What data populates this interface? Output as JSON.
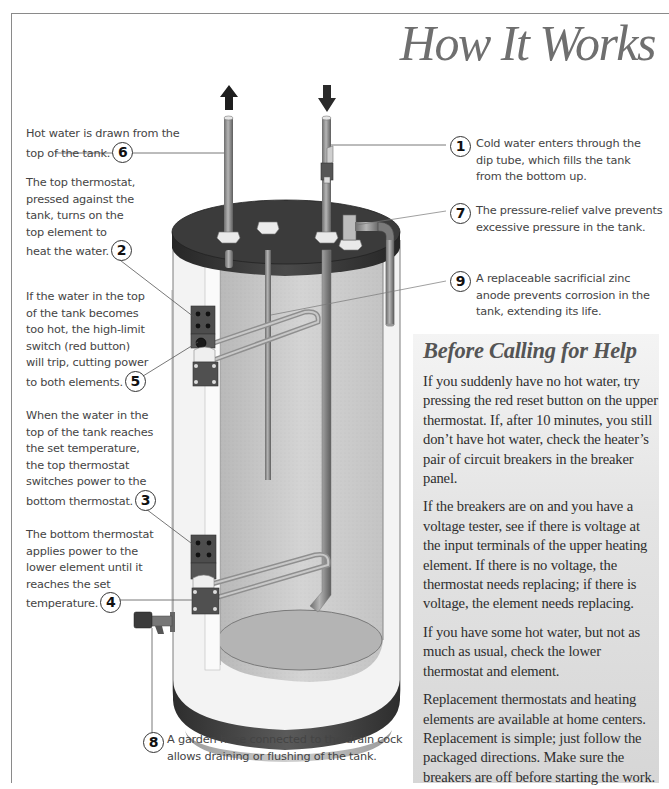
{
  "page": {
    "title": "How It Works"
  },
  "callouts": [
    {
      "number": "1",
      "text": "Cold water enters through the dip tube, which fills the tank from the bottom up."
    },
    {
      "number": "2",
      "text": "The top thermostat, pressed against the tank, turns on the top element to heat the water."
    },
    {
      "number": "3",
      "text": "When the water in the top of the tank reaches the set temperature, the top thermostat switches power to the bottom thermostat."
    },
    {
      "number": "4",
      "text": "The bottom thermostat applies power to the lower element until it reaches the set temperature."
    },
    {
      "number": "5",
      "text": "If the water in the top of the tank becomes too hot, the high-limit switch (red button) will trip, cutting power to both elements."
    },
    {
      "number": "6",
      "text": "Hot water is drawn from the top of the tank."
    },
    {
      "number": "7",
      "text": "The pressure-relief valve prevents excessive pressure in the tank."
    },
    {
      "number": "8",
      "text": "A garden hose connected to the drain cock allows draining or flushing of the tank."
    },
    {
      "number": "9",
      "text": "A replaceable sacrificial zinc anode prevents corrosion in the tank, extending its life."
    }
  ],
  "callout_lines": {
    "c1": [
      "Cold water enters through the",
      "dip tube, which fills the tank",
      "from the bottom up."
    ],
    "c2": [
      "The top thermostat,",
      "pressed against the",
      "tank, turns on the",
      "top element to",
      "heat the water."
    ],
    "c3": [
      "When the water in the",
      "top of the tank reaches",
      "the set temperature,",
      "the top thermostat",
      "switches power to the",
      "bottom thermostat."
    ],
    "c4": [
      "The bottom thermostat",
      "applies power to the",
      "lower element until it",
      "reaches the set",
      "temperature."
    ],
    "c5": [
      "If the water in the top",
      "of the tank becomes",
      "too hot, the high-limit",
      "switch (red button)",
      "will trip, cutting power",
      "to both elements."
    ],
    "c6": [
      "Hot water is drawn from the",
      "top of the tank."
    ],
    "c7": [
      "The pressure-relief valve prevents",
      "excessive pressure in the tank."
    ],
    "c8": [
      "A garden hose connected to the drain cock",
      "allows draining or flushing of the tank."
    ],
    "c9": [
      "A replaceable sacrificial zinc",
      "anode prevents corrosion in the",
      "tank, extending its life."
    ]
  },
  "sidebar": {
    "heading": "Before Calling for Help",
    "paragraphs": [
      "If you suddenly have no hot water, try pressing the red reset button on the upper thermostat. If, after 10 minutes, you still don’t have hot water, check the heater’s pair of circuit breakers in the breaker panel.",
      "If the breakers are on and you have a voltage tester, see if there is voltage at the input terminals of the upper heating element. If there is no voltage, the thermostat needs replacing; if there is voltage, the element needs replacing.",
      "If you have some hot water, but not as much as usual, check the lower thermostat and element.",
      "Replacement thermostats and heating elements are available at home centers. Replacement is simple; just follow the packaged directions. Make sure the breakers are off before starting the work."
    ]
  },
  "illustration": {
    "subject": "cutaway-electric-water-heater",
    "arrows": [
      {
        "id": "hot-out",
        "direction": "up"
      },
      {
        "id": "cold-in",
        "direction": "down"
      }
    ],
    "colors": {
      "lid": "#3a3a3a",
      "tank_interior": "#c9c9c9",
      "insulation": "#f0f0f0",
      "pipe": "#8c8c8c",
      "base_band": "#3f3f3f",
      "sidebar_bg": "#e2e2e2",
      "title": "#6f6f6f"
    }
  }
}
